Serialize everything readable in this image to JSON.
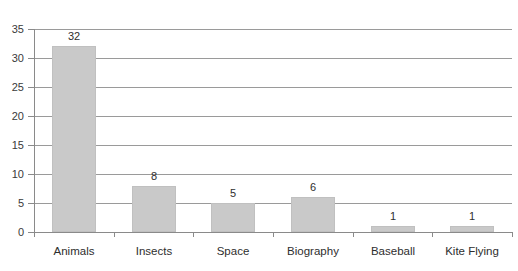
{
  "chart_data": {
    "type": "bar",
    "title": "",
    "xlabel": "",
    "ylabel": "",
    "categories": [
      "Animals",
      "Insects",
      "Space",
      "Biography",
      "Baseball",
      "Kite Flying"
    ],
    "values": [
      32,
      8,
      5,
      6,
      1,
      1
    ],
    "data_labels": [
      "32",
      "8",
      "5",
      "6",
      "1",
      "1"
    ],
    "ylim": [
      0,
      35
    ],
    "ytick_values": [
      0,
      5,
      10,
      15,
      20,
      25,
      30,
      35
    ],
    "ytick_labels": [
      "0",
      "5",
      "10",
      "15",
      "20",
      "25",
      "30",
      "35"
    ],
    "grid": true,
    "grid_axis": "y",
    "legend": false,
    "legend_position": "none",
    "orientation": "vertical",
    "bar_color": "#c9c9c9",
    "bar_border_color": "#c0c0c0",
    "gridline_color": "#9a9a9a",
    "axis_color": "#8a8a8a",
    "text_color": "#2e2e2e",
    "background_color": "#ffffff",
    "note": "chart title is cropped off the top edge of the screenshot"
  },
  "axis": {
    "y": {
      "ticks": [
        {
          "label": "35",
          "value": 35
        },
        {
          "label": "30",
          "value": 30
        },
        {
          "label": "25",
          "value": 25
        },
        {
          "label": "20",
          "value": 20
        },
        {
          "label": "15",
          "value": 15
        },
        {
          "label": "10",
          "value": 10
        },
        {
          "label": "5",
          "value": 5
        },
        {
          "label": "0",
          "value": 0
        }
      ]
    }
  },
  "bars": [
    {
      "category": "Animals",
      "value": 32,
      "label": "32"
    },
    {
      "category": "Insects",
      "value": 8,
      "label": "8"
    },
    {
      "category": "Space",
      "value": 5,
      "label": "5"
    },
    {
      "category": "Biography",
      "value": 6,
      "label": "6"
    },
    {
      "category": "Baseball",
      "value": 1,
      "label": "1"
    },
    {
      "category": "Kite Flying",
      "value": 1,
      "label": "1"
    }
  ],
  "title_fragment": ""
}
